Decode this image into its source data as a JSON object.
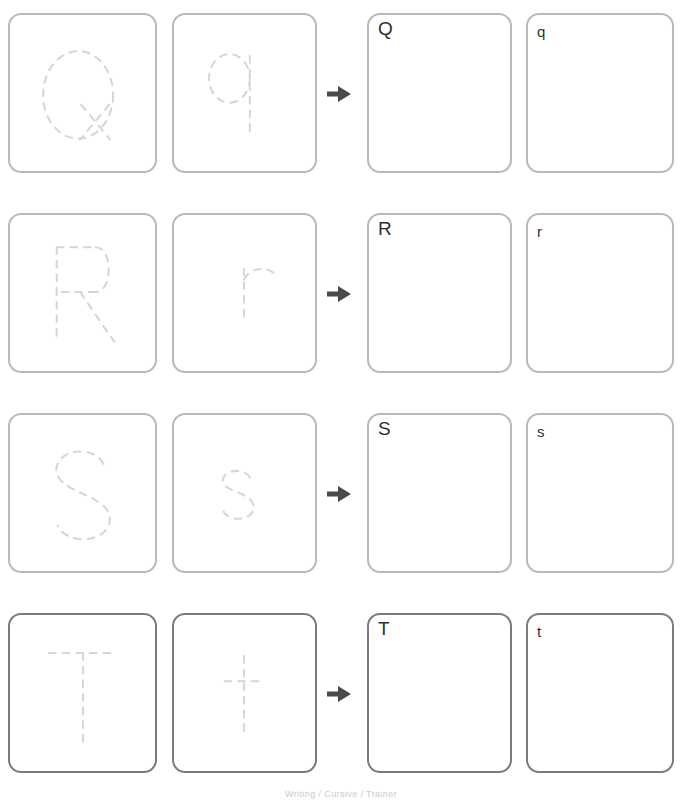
{
  "sheet": {
    "title": "Letter Tracing Practice",
    "footer_text": "Writing / Cursive / Trainer",
    "arrow_icon": "arrow-right-icon",
    "colors": {
      "tile_border": "#b9b9b9",
      "tile_border_emphasis": "#7b7b7b",
      "trace_stroke": "#d9d5d2",
      "cue_text": "#2f2f2f",
      "arrow": "#4a4a4a",
      "page_background": "#ffffff"
    }
  },
  "rows": [
    {
      "id": "row-q",
      "uppercase": "Q",
      "lowercase": "q",
      "emphasis": false,
      "trace_upper_label": "Q",
      "trace_lower_label": "q",
      "practice_upper_label": "Q",
      "practice_lower_label": "q"
    },
    {
      "id": "row-r",
      "uppercase": "R",
      "lowercase": "r",
      "emphasis": false,
      "trace_upper_label": "R",
      "trace_lower_label": "r",
      "practice_upper_label": "R",
      "practice_lower_label": "r"
    },
    {
      "id": "row-s",
      "uppercase": "S",
      "lowercase": "s",
      "emphasis": false,
      "trace_upper_label": "S",
      "trace_lower_label": "s",
      "practice_upper_label": "S",
      "practice_lower_label": "s"
    },
    {
      "id": "row-t",
      "uppercase": "T",
      "lowercase": "t",
      "emphasis": true,
      "trace_upper_label": "T",
      "trace_lower_label": "t",
      "practice_upper_label": "T",
      "practice_lower_label": "t"
    }
  ]
}
